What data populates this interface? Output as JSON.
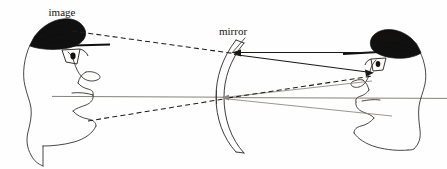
{
  "figure": {
    "type": "optics-ray-diagram",
    "background_color": "#fefefe",
    "ink_color": "#1a1815",
    "gray_color": "#8d8a85"
  },
  "labels": {
    "image": "image",
    "mirror": "mirror",
    "object": "object"
  },
  "label_positions": {
    "image": {
      "x": 62,
      "y": 13
    },
    "mirror": {
      "x": 233,
      "y": 32
    },
    "object": {
      "x": 390,
      "y": 37
    }
  },
  "elements": {
    "object_head": {
      "name": "object-head",
      "side": "right",
      "facing": "left",
      "eye": {
        "x": 369,
        "y": 72
      }
    },
    "image_head": {
      "name": "image-head",
      "side": "left",
      "facing": "right",
      "eye": {
        "x": 80,
        "y": 57
      },
      "style": "virtual image, mirrored and magnified"
    },
    "mirror": {
      "name": "concave-mirror",
      "vertex": {
        "x": 224,
        "y": 97
      },
      "top_edge": {
        "x": 236,
        "y": 40
      },
      "bottom_edge": {
        "x": 242,
        "y": 152
      },
      "curvature": "concave toward the object (right)"
    },
    "optical_axis": {
      "name": "optical-axis",
      "from": {
        "x": 52,
        "y": 96
      },
      "to": {
        "x": 447,
        "y": 98
      },
      "color": "#7e7b76"
    }
  },
  "rays": [
    {
      "name": "incident-ray-upper",
      "style": "solid",
      "from": {
        "x": 369,
        "y": 55
      },
      "to": {
        "x": 233,
        "y": 53
      },
      "arrow_at": "to"
    },
    {
      "name": "reflected-ray-upper",
      "style": "solid",
      "from": {
        "x": 233,
        "y": 54
      },
      "to": {
        "x": 370,
        "y": 73
      },
      "arrow_at": "to"
    },
    {
      "name": "incident-ray-axis",
      "style": "gray",
      "from": {
        "x": 372,
        "y": 80
      },
      "to": {
        "x": 226,
        "y": 97
      },
      "arrow_at": "to"
    },
    {
      "name": "reflected-ray-axis",
      "style": "gray",
      "from": {
        "x": 226,
        "y": 98
      },
      "to": {
        "x": 380,
        "y": 112
      }
    },
    {
      "name": "virtual-ray-upper",
      "style": "dashed",
      "from": {
        "x": 72,
        "y": 31
      },
      "to": {
        "x": 233,
        "y": 54
      }
    },
    {
      "name": "virtual-ray-lower",
      "style": "dashed",
      "from": {
        "x": 88,
        "y": 121
      },
      "to": {
        "x": 228,
        "y": 99
      }
    },
    {
      "name": "virtual-ray-extension",
      "style": "dashed",
      "from": {
        "x": 228,
        "y": 99
      },
      "to": {
        "x": 372,
        "y": 76
      }
    },
    {
      "name": "image-axis-ray",
      "style": "gray",
      "from": {
        "x": 52,
        "y": 96
      },
      "to": {
        "x": 224,
        "y": 97
      }
    }
  ]
}
